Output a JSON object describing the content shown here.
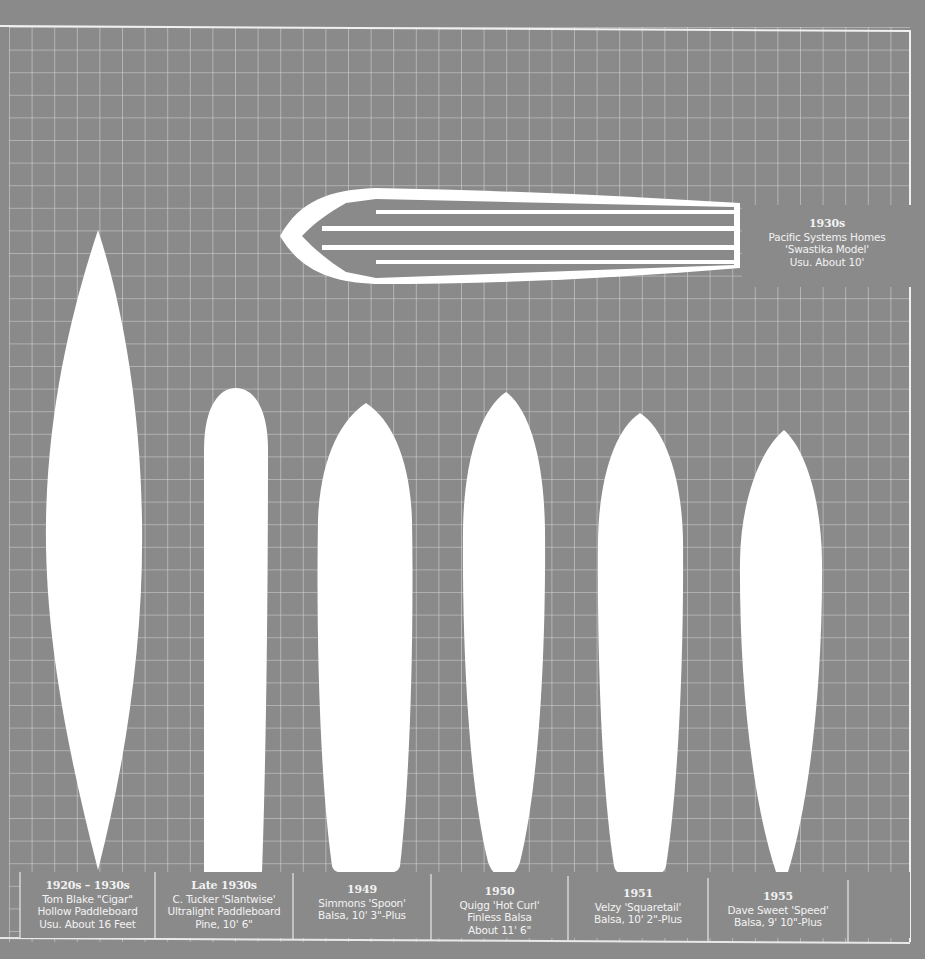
{
  "colors": {
    "background": "#8a8a8a",
    "grid_line": "#d9d9d9",
    "board_fill": "#ffffff",
    "text": "#f2f2f2"
  },
  "grid": {
    "spacing_px": 22.5,
    "frame": {
      "left": 9,
      "top": 27,
      "right": 910,
      "bottom": 942
    }
  },
  "featured_board": {
    "era": "1930s",
    "line1": "Pacific Systems Homes",
    "line2": "'Swastika Model'",
    "line3": "Usu. About 10'"
  },
  "boards": [
    {
      "era": "1920s – 1930s",
      "line1": "Tom Blake \"Cigar\"",
      "line2": "Hollow Paddleboard",
      "line3": "Usu. About 16 Feet"
    },
    {
      "era": "Late 1930s",
      "line1": "C. Tucker 'Slantwise'",
      "line2": "Ultralight Paddleboard",
      "line3": "Pine, 10' 6\""
    },
    {
      "era": "1949",
      "line1": "Simmons 'Spoon'",
      "line2": "Balsa, 10' 3\"-Plus",
      "line3": ""
    },
    {
      "era": "1950",
      "line1": "Quigg 'Hot Curl'",
      "line2": "Finless Balsa",
      "line3": "About 11' 6\""
    },
    {
      "era": "1951",
      "line1": "Velzy 'Squaretail'",
      "line2": "Balsa, 10' 2\"-Plus",
      "line3": ""
    },
    {
      "era": "1955",
      "line1": "Dave Sweet 'Speed'",
      "line2": "Balsa, 9' 10\"-Plus",
      "line3": ""
    }
  ]
}
